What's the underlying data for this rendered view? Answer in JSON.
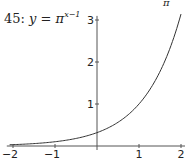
{
  "title": {
    "number": "45:",
    "lhs": "y",
    "eq": "=",
    "base": "π",
    "exponent": "x−1"
  },
  "top_fragment": "π",
  "chart_data": {
    "type": "line",
    "function": "y = pi^(x-1)",
    "xlabel": "",
    "ylabel": "",
    "xlim": [
      -2.1,
      2.05
    ],
    "ylim": [
      0,
      3.05
    ],
    "x_ticks": [
      -2,
      -1,
      1,
      2
    ],
    "x_tick_labels": [
      "−2",
      "−1",
      "1",
      "2"
    ],
    "y_ticks": [
      1,
      2,
      3
    ],
    "y_tick_labels": [
      "1",
      "2",
      "3"
    ],
    "grid": false,
    "legend": null,
    "series": [
      {
        "name": "π^(x−1)",
        "x": [
          -2,
          -1.5,
          -1,
          -0.5,
          0,
          0.5,
          1,
          1.5,
          2
        ],
        "y": [
          0.032,
          0.057,
          0.101,
          0.18,
          0.318,
          0.564,
          1.0,
          1.772,
          3.142
        ]
      }
    ],
    "axis_color": "#555555",
    "line_color": "#333333"
  }
}
